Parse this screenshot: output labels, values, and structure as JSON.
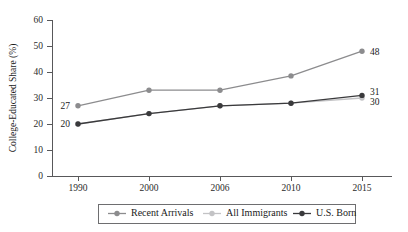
{
  "chart_data": {
    "type": "line",
    "title": "",
    "xlabel": "",
    "ylabel": "College-Educated Share (%)",
    "categories": [
      "1990",
      "2000",
      "2006",
      "2010",
      "2015"
    ],
    "x_tick_labels": [
      "1990",
      "2000",
      "2006",
      "2010",
      "2015"
    ],
    "y_tick_labels": [
      "0",
      "10",
      "20",
      "30",
      "40",
      "50",
      "60"
    ],
    "y_ticks": [
      0,
      10,
      20,
      30,
      40,
      50,
      60
    ],
    "ylim": [
      0,
      60
    ],
    "grid": false,
    "legend_position": "bottom",
    "series": [
      {
        "name": "Recent Arrivals",
        "color": "#8c8c8e",
        "values": [
          27,
          33,
          33,
          38.5,
          48
        ]
      },
      {
        "name": "All Immigrants",
        "color": "#c3c3c5",
        "values": [
          20,
          24,
          27,
          28,
          30
        ]
      },
      {
        "name": "U.S. Born",
        "color": "#3a3a3c",
        "values": [
          20,
          24,
          27,
          28,
          31
        ]
      }
    ],
    "annotations": [
      {
        "text": "27",
        "series": "Recent Arrivals",
        "category": "1990",
        "side": "left"
      },
      {
        "text": "20",
        "series": "U.S. Born",
        "category": "1990",
        "side": "left"
      },
      {
        "text": "48",
        "series": "Recent Arrivals",
        "category": "2015",
        "side": "right"
      },
      {
        "text": "31",
        "series": "U.S. Born",
        "category": "2015",
        "side": "right"
      },
      {
        "text": "30",
        "series": "All Immigrants",
        "category": "2015",
        "side": "right"
      }
    ]
  },
  "legend": {
    "items": [
      {
        "label": "Recent Arrivals"
      },
      {
        "label": "All Immigrants"
      },
      {
        "label": "U.S. Born"
      }
    ]
  }
}
